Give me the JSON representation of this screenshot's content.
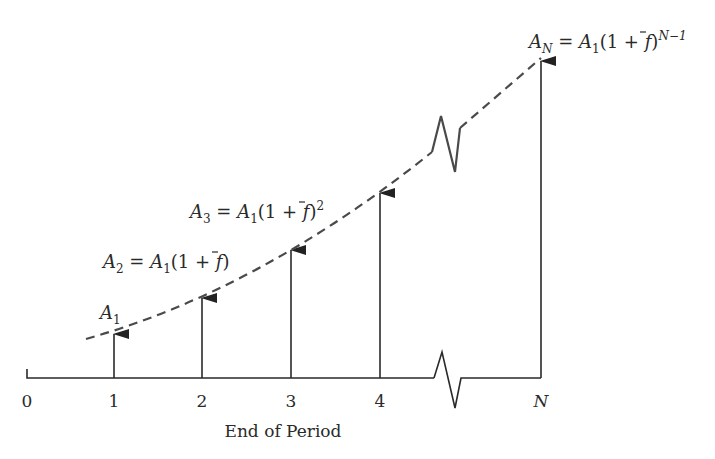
{
  "diagram": {
    "axis": {
      "label": "End of Period",
      "ticks": [
        "0",
        "1",
        "2",
        "3",
        "4",
        "N"
      ]
    },
    "cash_flows": [
      {
        "period": "1",
        "symbol": "A",
        "subscript": "1",
        "formula_rhs": ""
      },
      {
        "period": "2",
        "symbol": "A",
        "subscript": "2",
        "formula_rhs": "A1(1 + f̄)"
      },
      {
        "period": "3",
        "symbol": "A",
        "subscript": "3",
        "formula_rhs": "A1(1 + f̄)^2"
      },
      {
        "period": "4",
        "symbol": "",
        "subscript": "",
        "formula_rhs": ""
      },
      {
        "period": "N",
        "symbol": "A",
        "subscript": "N",
        "formula_rhs": "A1(1 + f̄)^(N−1)"
      }
    ],
    "labels": {
      "a1": {
        "base": "A",
        "sub": "1"
      },
      "a2": {
        "base": "A",
        "sub": "2",
        "eq": " = ",
        "rhs_base": "A",
        "rhs_sub": "1",
        "rhs_tail": "(1 + ",
        "f": "f",
        "close": ")"
      },
      "a3": {
        "base": "A",
        "sub": "3",
        "eq": " = ",
        "rhs_base": "A",
        "rhs_sub": "1",
        "rhs_tail": "(1 + ",
        "f": "f",
        "close": ")",
        "exp": "2"
      },
      "an": {
        "base": "A",
        "sub": "N",
        "eq": " = ",
        "rhs_base": "A",
        "rhs_sub": "1",
        "rhs_tail": "(1 + ",
        "f": "f",
        "close": ")",
        "exp": "N−1"
      }
    },
    "colors": {
      "line": "#2a2a2a",
      "dash": "#4a4a4a",
      "text": "#2a2a2a"
    }
  }
}
